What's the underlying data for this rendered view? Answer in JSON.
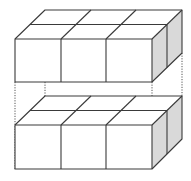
{
  "diagram": {
    "title": "",
    "blocks": [
      {
        "name": "top-block",
        "cubes_wide": 3,
        "cubes_deep": 2,
        "cubes_high": 1
      },
      {
        "name": "bottom-block",
        "cubes_wide": 3,
        "cubes_deep": 2,
        "cubes_high": 1
      }
    ],
    "colors": {
      "edge": "#3a3a3a",
      "side_shade": "#d9d9d9",
      "face": "#ffffff",
      "connector": "#555555"
    }
  }
}
